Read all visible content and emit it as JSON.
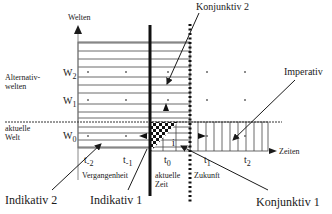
{
  "axes": {
    "y_label": "Welten",
    "x_label": "Zeiten"
  },
  "regions": {
    "alternative_worlds": "Alternativ-\nwelten",
    "alternative_worlds_line1": "Alternativ-",
    "alternative_worlds_line2": "welten",
    "actual_world_line1": "aktuelle",
    "actual_world_line2": "Welt"
  },
  "worlds": [
    {
      "main": "W",
      "sub": "2"
    },
    {
      "main": "W",
      "sub": "1"
    },
    {
      "main": "W",
      "sub": "0"
    }
  ],
  "times": [
    {
      "main": "t",
      "sub": "-2"
    },
    {
      "main": "t",
      "sub": "-1"
    },
    {
      "main": "t",
      "sub": "0"
    },
    {
      "main": "t",
      "sub": "1"
    },
    {
      "main": "t",
      "sub": "2"
    }
  ],
  "time_regions": {
    "past": "Vergangenheit",
    "present_line1": "aktuelle",
    "present_line2": "Zeit",
    "future": "Zukunft"
  },
  "moods": {
    "konjunktiv2": "Konjunktiv 2",
    "imperativ": "Imperativ",
    "indikativ2": "Indikativ 2",
    "indikativ1": "Indikativ 1",
    "konjunktiv1": "Konjunktiv 1"
  },
  "center_marker": "i",
  "colors": {
    "ink": "#1a1a1a",
    "stripe": "#444444",
    "dot": "#666666",
    "background": "#ffffff"
  }
}
